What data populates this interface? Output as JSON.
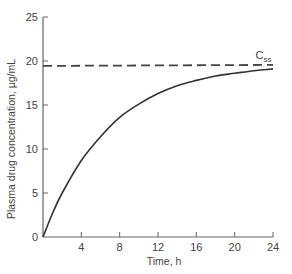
{
  "chart_data": {
    "type": "line",
    "title": "",
    "xlabel": "Time, h",
    "ylabel": "Plasma drug concentration, µg/mL",
    "xlim": [
      0,
      24
    ],
    "ylim": [
      0,
      25
    ],
    "x_ticks": [
      4,
      8,
      12,
      16,
      20,
      24
    ],
    "y_ticks": [
      0,
      5,
      10,
      15,
      20,
      25
    ],
    "grid": false,
    "legend": null,
    "series": [
      {
        "name": "Plasma concentration",
        "style": "solid",
        "x": [
          0,
          1,
          2,
          4,
          6,
          8,
          10,
          12,
          14,
          16,
          18,
          20,
          22,
          24
        ],
        "values": [
          0,
          2.7,
          5.0,
          8.7,
          11.4,
          13.6,
          15.1,
          16.3,
          17.2,
          17.8,
          18.3,
          18.6,
          18.9,
          19.1
        ]
      },
      {
        "name": "Css",
        "style": "dashed",
        "x": [
          0,
          24
        ],
        "values": [
          19.5,
          19.5
        ]
      }
    ],
    "annotations": [
      {
        "text": "C",
        "subscript": "ss",
        "x": 23,
        "y": 20.5
      }
    ],
    "origin_label": "0"
  }
}
